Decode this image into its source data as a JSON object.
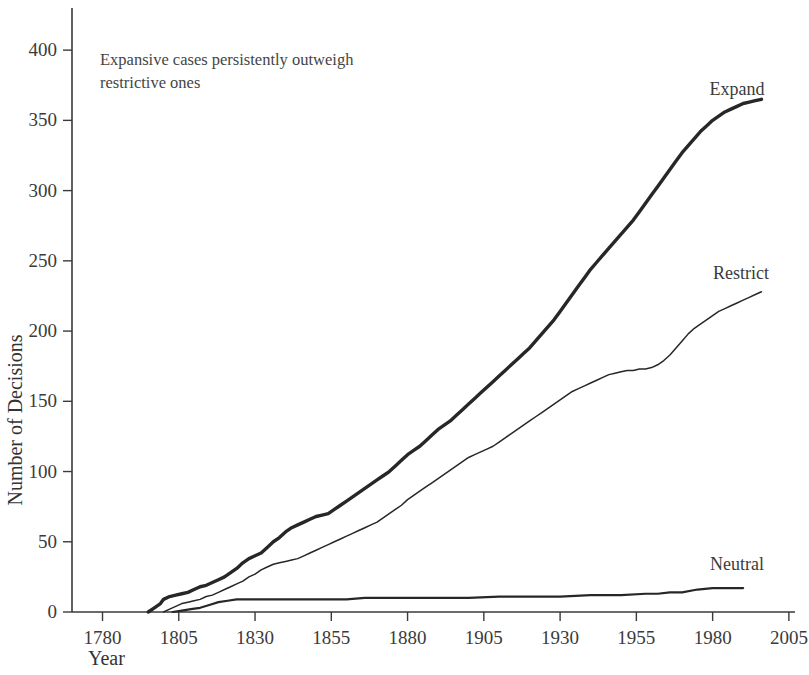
{
  "chart_data": {
    "type": "line",
    "title": "",
    "xlabel": "Year",
    "ylabel": "Number of Decisions",
    "xlim": [
      1770,
      2007
    ],
    "ylim": [
      0,
      430
    ],
    "xticks": [
      1780,
      1805,
      1830,
      1855,
      1880,
      1905,
      1930,
      1955,
      1980,
      2005
    ],
    "yticks": [
      0,
      50,
      100,
      150,
      200,
      250,
      300,
      350,
      400
    ],
    "grid": false,
    "legend_position": "right-inline-labels",
    "annotations": [
      {
        "text_line1": "Expansive cases persistently outweigh",
        "text_line2": "restrictive ones",
        "x": 1795,
        "y": 400
      }
    ],
    "series": [
      {
        "name": "Expand",
        "label": "Expand",
        "color": "#272727",
        "line_width": 3.4,
        "x": [
          1795,
          1797,
          1799,
          1800,
          1802,
          1804,
          1806,
          1808,
          1810,
          1812,
          1814,
          1816,
          1818,
          1820,
          1822,
          1824,
          1826,
          1828,
          1830,
          1832,
          1834,
          1836,
          1838,
          1840,
          1842,
          1844,
          1846,
          1848,
          1850,
          1852,
          1854,
          1856,
          1858,
          1860,
          1862,
          1864,
          1866,
          1868,
          1870,
          1872,
          1874,
          1876,
          1878,
          1880,
          1882,
          1884,
          1886,
          1888,
          1890,
          1892,
          1894,
          1896,
          1898,
          1900,
          1902,
          1904,
          1906,
          1908,
          1910,
          1912,
          1914,
          1916,
          1918,
          1920,
          1922,
          1924,
          1926,
          1928,
          1930,
          1932,
          1934,
          1936,
          1938,
          1940,
          1942,
          1944,
          1946,
          1948,
          1950,
          1952,
          1954,
          1956,
          1958,
          1960,
          1962,
          1964,
          1966,
          1968,
          1970,
          1972,
          1974,
          1976,
          1978,
          1980,
          1982,
          1984,
          1986,
          1988,
          1990,
          1992,
          1994,
          1996
        ],
        "y": [
          0,
          3,
          6,
          9,
          11,
          12,
          13,
          14,
          16,
          18,
          19,
          21,
          23,
          25,
          28,
          31,
          35,
          38,
          40,
          42,
          46,
          50,
          53,
          57,
          60,
          62,
          64,
          66,
          68,
          69,
          70,
          73,
          76,
          79,
          82,
          85,
          88,
          91,
          94,
          97,
          100,
          104,
          108,
          112,
          115,
          118,
          122,
          126,
          130,
          133,
          136,
          140,
          144,
          148,
          152,
          156,
          160,
          164,
          168,
          172,
          176,
          180,
          184,
          188,
          193,
          198,
          203,
          208,
          214,
          220,
          226,
          232,
          238,
          244,
          249,
          254,
          259,
          264,
          269,
          274,
          279,
          285,
          291,
          297,
          303,
          309,
          315,
          321,
          327,
          332,
          337,
          342,
          346,
          350,
          353,
          356,
          358,
          360,
          362,
          363,
          364,
          365
        ]
      },
      {
        "name": "Restrict",
        "label": "Restrict",
        "color": "#3a3a3a",
        "line_width": 1.5,
        "x": [
          1800,
          1802,
          1804,
          1806,
          1808,
          1810,
          1812,
          1814,
          1816,
          1818,
          1820,
          1822,
          1824,
          1826,
          1828,
          1830,
          1832,
          1834,
          1836,
          1838,
          1840,
          1842,
          1844,
          1846,
          1848,
          1850,
          1852,
          1854,
          1856,
          1858,
          1860,
          1862,
          1864,
          1866,
          1868,
          1870,
          1872,
          1874,
          1876,
          1878,
          1880,
          1882,
          1884,
          1886,
          1888,
          1890,
          1892,
          1894,
          1896,
          1898,
          1900,
          1902,
          1904,
          1906,
          1908,
          1910,
          1912,
          1914,
          1916,
          1918,
          1920,
          1922,
          1924,
          1926,
          1928,
          1930,
          1932,
          1934,
          1936,
          1938,
          1940,
          1942,
          1944,
          1946,
          1948,
          1950,
          1952,
          1954,
          1956,
          1958,
          1960,
          1962,
          1964,
          1966,
          1968,
          1970,
          1972,
          1974,
          1976,
          1978,
          1980,
          1982,
          1984,
          1986,
          1988,
          1990,
          1992,
          1994,
          1996
        ],
        "y": [
          0,
          2,
          4,
          6,
          7,
          8,
          9,
          11,
          12,
          14,
          16,
          18,
          20,
          22,
          25,
          27,
          30,
          32,
          34,
          35,
          36,
          37,
          38,
          40,
          42,
          44,
          46,
          48,
          50,
          52,
          54,
          56,
          58,
          60,
          62,
          64,
          67,
          70,
          73,
          76,
          80,
          83,
          86,
          89,
          92,
          95,
          98,
          101,
          104,
          107,
          110,
          112,
          114,
          116,
          118,
          121,
          124,
          127,
          130,
          133,
          136,
          139,
          142,
          145,
          148,
          151,
          154,
          157,
          159,
          161,
          163,
          165,
          167,
          169,
          170,
          171,
          172,
          172,
          173,
          173,
          174,
          176,
          179,
          183,
          188,
          193,
          198,
          202,
          205,
          208,
          211,
          214,
          216,
          218,
          220,
          222,
          224,
          226,
          228
        ]
      },
      {
        "name": "Neutral",
        "label": "Neutral",
        "color": "#272727",
        "line_width": 2.2,
        "x": [
          1803,
          1806,
          1809,
          1812,
          1815,
          1818,
          1821,
          1824,
          1830,
          1840,
          1850,
          1860,
          1866,
          1870,
          1880,
          1890,
          1900,
          1910,
          1920,
          1930,
          1940,
          1950,
          1958,
          1962,
          1966,
          1970,
          1975,
          1980,
          1986,
          1990
        ],
        "y": [
          0,
          1,
          2,
          3,
          5,
          7,
          8,
          9,
          9,
          9,
          9,
          9,
          10,
          10,
          10,
          10,
          10,
          11,
          11,
          11,
          12,
          12,
          13,
          13,
          14,
          14,
          16,
          17,
          17,
          17
        ]
      }
    ]
  },
  "axis": {
    "y_title": "Number of Decisions",
    "x_title": "Year"
  },
  "labels": {
    "expand": "Expand",
    "restrict": "Restrict",
    "neutral": "Neutral"
  },
  "annotation": {
    "line1": "Expansive cases persistently outweigh",
    "line2": "restrictive ones"
  },
  "colors": {
    "ink": "#272727",
    "axis": "#3a3a3a",
    "background": "#ffffff"
  }
}
